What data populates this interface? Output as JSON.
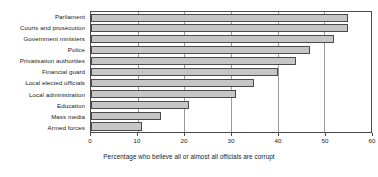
{
  "chart_data": {
    "type": "bar",
    "orientation": "horizontal",
    "title": "",
    "xlabel": "Percentage who believe all or almost all officials are corrupt",
    "ylabel": "",
    "xlim": [
      0,
      60
    ],
    "xticks": [
      0,
      10,
      20,
      30,
      40,
      50,
      60
    ],
    "grid": true,
    "legend": false,
    "bar_fill_color": "#c6c6c6",
    "bar_edge_color": "#4a4a4a",
    "categories": [
      "Parliament",
      "Courts and prosecution",
      "Government ministers",
      "Police",
      "Privatisation authorities",
      "Financial guard",
      "Local elected officials",
      "Local administration",
      "Education",
      "Mass media",
      "Armed forces"
    ],
    "values": [
      55,
      55,
      52,
      47,
      44,
      40,
      35,
      31,
      21,
      15,
      11
    ]
  }
}
